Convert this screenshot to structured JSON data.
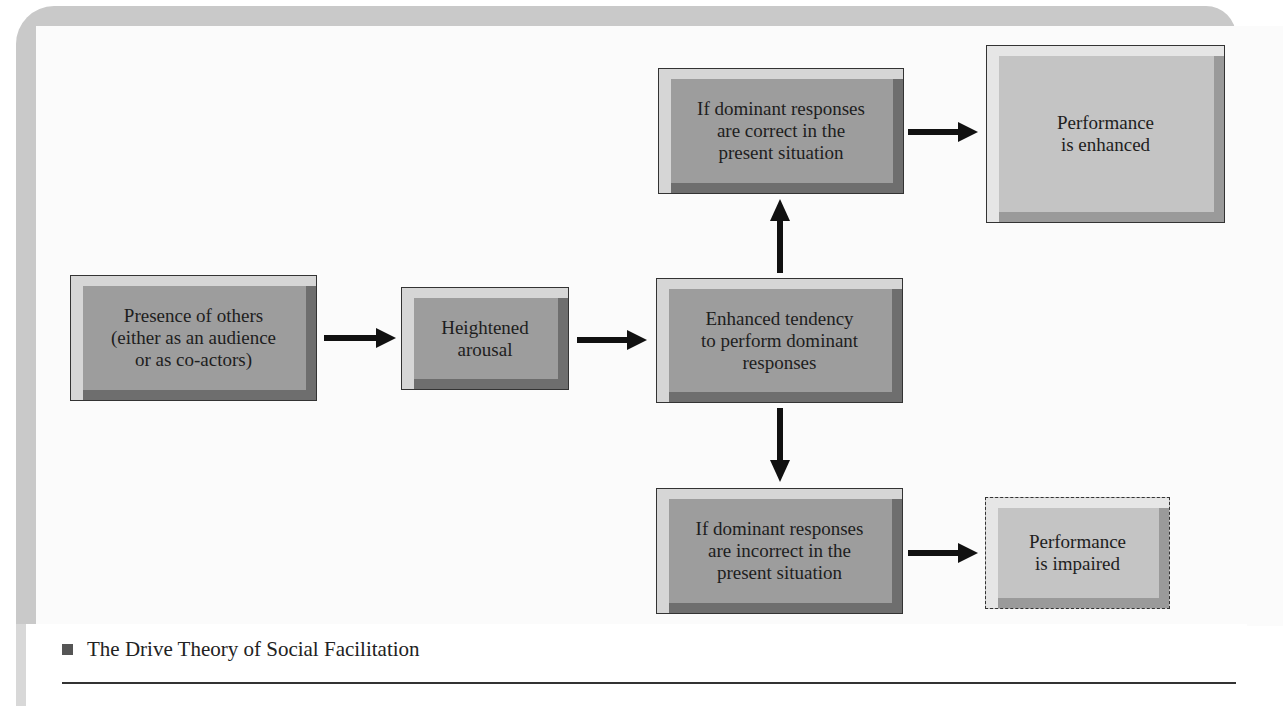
{
  "figure": {
    "caption": "The Drive Theory of Social Facilitation",
    "colors": {
      "box_fill": "#9d9d9d",
      "outcome_fill": "#c4c4c4",
      "border": "#333333",
      "arrow": "#111111",
      "frame": "#c9c9c9"
    }
  },
  "nodes": {
    "presence": {
      "label": "Presence of others\n(either as an audience\nor as co-actors)"
    },
    "arousal": {
      "label": "Heightened\narousal"
    },
    "tendency": {
      "label": "Enhanced tendency\nto perform dominant\nresponses"
    },
    "correct": {
      "label": "If dominant responses\nare correct in the\npresent situation"
    },
    "enhanced": {
      "label": "Performance\nis enhanced"
    },
    "incorrect": {
      "label": "If dominant responses\nare incorrect in the\npresent situation"
    },
    "impaired": {
      "label": "Performance\nis impaired"
    }
  },
  "edges": [
    {
      "from": "presence",
      "to": "arousal"
    },
    {
      "from": "arousal",
      "to": "tendency"
    },
    {
      "from": "tendency",
      "to": "correct"
    },
    {
      "from": "tendency",
      "to": "incorrect"
    },
    {
      "from": "correct",
      "to": "enhanced"
    },
    {
      "from": "incorrect",
      "to": "impaired"
    }
  ]
}
